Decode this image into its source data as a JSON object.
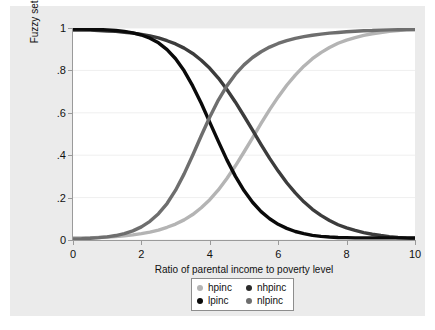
{
  "chart_data": {
    "type": "line",
    "title": "",
    "xlabel": "Ratio of parental income to poverty level",
    "ylabel": "Fuzzy set membership",
    "xlim": [
      0,
      10
    ],
    "ylim": [
      0,
      1
    ],
    "xticks": [
      "0",
      "2",
      "4",
      "6",
      "8",
      "10"
    ],
    "xtick_values": [
      0,
      2,
      4,
      6,
      8,
      10
    ],
    "yticks": [
      "0",
      ".2",
      ".4",
      ".6",
      ".8",
      "1"
    ],
    "ytick_values": [
      0,
      0.2,
      0.4,
      0.6,
      0.8,
      1
    ],
    "grid": "horizontal",
    "legend_position": "bottom-center",
    "x": [
      0,
      0.25,
      0.5,
      0.75,
      1,
      1.25,
      1.5,
      1.75,
      2,
      2.25,
      2.5,
      2.75,
      3,
      3.25,
      3.5,
      3.75,
      4,
      4.25,
      4.5,
      4.75,
      5,
      5.25,
      5.5,
      5.75,
      6,
      6.25,
      6.5,
      6.75,
      7,
      7.25,
      7.5,
      7.75,
      8,
      8.25,
      8.5,
      8.75,
      9,
      9.25,
      9.5,
      9.75,
      10
    ],
    "series": [
      {
        "name": "hpinc",
        "color": "#b4b4b4",
        "values": [
          0.01,
          0.01,
          0.01,
          0.012,
          0.014,
          0.016,
          0.02,
          0.024,
          0.03,
          0.037,
          0.047,
          0.06,
          0.075,
          0.095,
          0.12,
          0.152,
          0.19,
          0.236,
          0.29,
          0.35,
          0.415,
          0.482,
          0.55,
          0.615,
          0.675,
          0.73,
          0.778,
          0.82,
          0.855,
          0.884,
          0.908,
          0.928,
          0.943,
          0.955,
          0.965,
          0.973,
          0.979,
          0.984,
          0.988,
          0.991,
          0.993
        ]
      },
      {
        "name": "nhpinc",
        "color": "#3c3c3c",
        "values": [
          0.99,
          0.99,
          0.99,
          0.988,
          0.986,
          0.984,
          0.98,
          0.976,
          0.97,
          0.963,
          0.953,
          0.94,
          0.925,
          0.905,
          0.88,
          0.848,
          0.81,
          0.764,
          0.71,
          0.65,
          0.585,
          0.518,
          0.45,
          0.385,
          0.325,
          0.27,
          0.222,
          0.18,
          0.145,
          0.116,
          0.092,
          0.072,
          0.057,
          0.045,
          0.035,
          0.027,
          0.021,
          0.016,
          0.012,
          0.009,
          0.007
        ]
      },
      {
        "name": "lpinc",
        "color": "#0a0a0a",
        "values": [
          0.995,
          0.995,
          0.994,
          0.993,
          0.991,
          0.988,
          0.984,
          0.977,
          0.967,
          0.952,
          0.93,
          0.898,
          0.855,
          0.798,
          0.727,
          0.645,
          0.555,
          0.465,
          0.378,
          0.3,
          0.233,
          0.178,
          0.134,
          0.1,
          0.074,
          0.055,
          0.04,
          0.03,
          0.022,
          0.017,
          0.014,
          0.012,
          0.011,
          0.01,
          0.01,
          0.01,
          0.01,
          0.01,
          0.01,
          0.01,
          0.01
        ]
      },
      {
        "name": "nlpinc",
        "color": "#6e6e6e",
        "values": [
          0.005,
          0.006,
          0.008,
          0.011,
          0.015,
          0.021,
          0.03,
          0.043,
          0.062,
          0.088,
          0.124,
          0.172,
          0.235,
          0.312,
          0.4,
          0.492,
          0.58,
          0.66,
          0.727,
          0.782,
          0.826,
          0.861,
          0.888,
          0.91,
          0.927,
          0.94,
          0.951,
          0.959,
          0.966,
          0.971,
          0.976,
          0.979,
          0.982,
          0.985,
          0.987,
          0.988,
          0.99,
          0.991,
          0.992,
          0.993,
          0.993
        ]
      }
    ]
  },
  "legend": {
    "items": [
      {
        "label": "hpinc",
        "color": "#b4b4b4"
      },
      {
        "label": "nhpinc",
        "color": "#2b2b2b"
      },
      {
        "label": "lpinc",
        "color": "#0a0a0a"
      },
      {
        "label": "nlpinc",
        "color": "#6e6e6e"
      }
    ]
  },
  "colors": {
    "graph_background": "#ebebeb",
    "plot_background": "#ffffff",
    "axis_line": "#9a9a9a",
    "grid_line": "#efefef"
  }
}
